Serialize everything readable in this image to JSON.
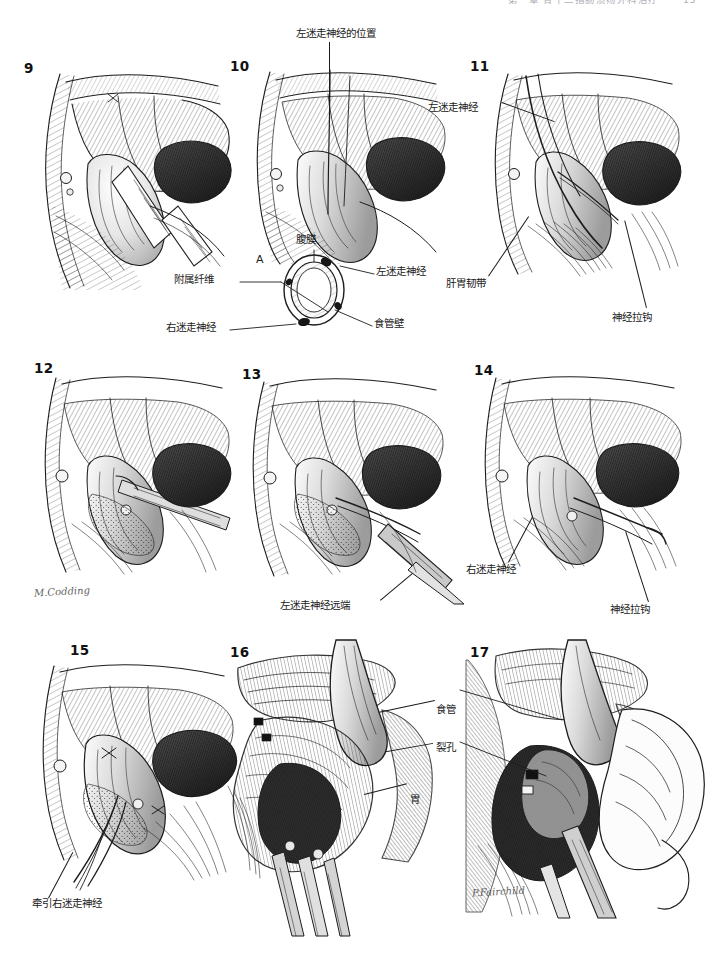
{
  "running_head": {
    "chapter_title": "第一章  胃十二指肠溃疡外科治疗",
    "page_number": "15"
  },
  "figure": {
    "caption_note": "",
    "signatures": [
      {
        "name": "M.Codding",
        "panel": "12"
      },
      {
        "name": "P.Fairchild",
        "panel": "17"
      }
    ]
  },
  "panels": [
    {
      "number": "9",
      "labels": []
    },
    {
      "number": "10",
      "labels": [
        {
          "text": "左迷走神经的位置",
          "role": "position-of-left-vagus-nerve"
        }
      ],
      "inset": {
        "letter": "A",
        "labels": [
          {
            "text": "腹膜",
            "role": "peritoneum"
          },
          {
            "text": "左迷走神经",
            "role": "left-vagus-nerve"
          },
          {
            "text": "附属纤维",
            "role": "accessory-fibers"
          },
          {
            "text": "右迷走神经",
            "role": "right-vagus-nerve"
          },
          {
            "text": "食管壁",
            "role": "esophageal-wall"
          }
        ]
      }
    },
    {
      "number": "11",
      "labels": [
        {
          "text": "左迷走神经",
          "role": "left-vagus-nerve"
        },
        {
          "text": "肝胃韧带",
          "role": "hepatogastric-ligament"
        },
        {
          "text": "神经拉钩",
          "role": "nerve-hook"
        }
      ]
    },
    {
      "number": "12",
      "labels": []
    },
    {
      "number": "13",
      "labels": [
        {
          "text": "左迷走神经远端",
          "role": "distal-left-vagus-nerve"
        }
      ]
    },
    {
      "number": "14",
      "labels": [
        {
          "text": "右迷走神经",
          "role": "right-vagus-nerve"
        },
        {
          "text": "神经拉钩",
          "role": "nerve-hook"
        }
      ]
    },
    {
      "number": "15",
      "labels": [
        {
          "text": "牵引右迷走神经",
          "role": "retract-right-vagus-nerve"
        }
      ]
    },
    {
      "number": "16",
      "labels": [
        {
          "text": "食管",
          "role": "esophagus"
        },
        {
          "text": "裂孔",
          "role": "hiatus"
        },
        {
          "text": "胃",
          "role": "stomach"
        }
      ]
    },
    {
      "number": "17",
      "labels": []
    }
  ],
  "colors": {
    "ink": "#1d1d1d",
    "paper": "#ffffff",
    "shadow_dark": "#2b2b2b",
    "shadow_mid": "#8a8a8a",
    "shadow_light": "#d8d8d8"
  }
}
